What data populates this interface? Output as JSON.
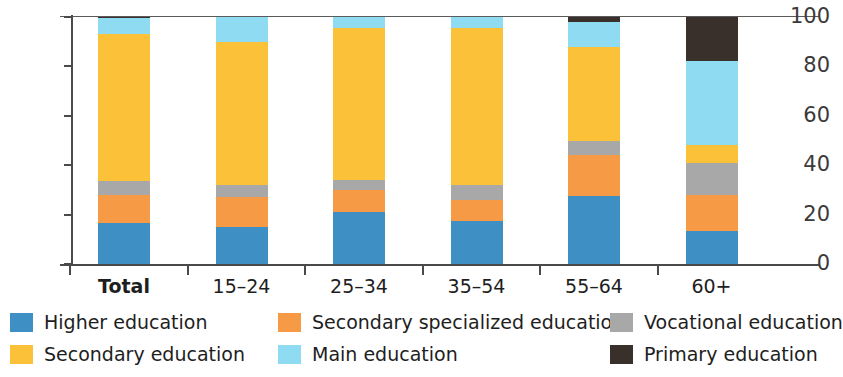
{
  "chart_data": {
    "type": "bar",
    "title": "",
    "subtitle": "",
    "xlabel": "",
    "ylabel": "",
    "stacked": true,
    "stack_mode": "percent",
    "grid": false,
    "legend_position": "bottom",
    "ylim": [
      0,
      100
    ],
    "yticks": [
      0,
      20,
      40,
      60,
      80,
      100
    ],
    "ytick_labels": [
      "0",
      "20",
      "40",
      "60",
      "80",
      "100"
    ],
    "categories": [
      "Total",
      "15–24",
      "25–34",
      "35–54",
      "55–64",
      "60+"
    ],
    "series": [
      {
        "name": "Higher education",
        "color": "#3D8FC4",
        "values": [
          16.5,
          15.0,
          21.0,
          17.5,
          27.5,
          13.5
        ]
      },
      {
        "name": "Secondary specialized education",
        "color": "#F79A46",
        "values": [
          11.5,
          12.0,
          9.0,
          8.5,
          16.5,
          14.5
        ]
      },
      {
        "name": "Vocational education",
        "color": "#A8A8A8",
        "values": [
          5.5,
          5.0,
          4.0,
          6.0,
          6.0,
          13.0
        ]
      },
      {
        "name": "Secondary education",
        "color": "#FBC138",
        "values": [
          59.5,
          58.0,
          61.5,
          63.5,
          38.0,
          7.0
        ]
      },
      {
        "name": "Main education",
        "color": "#8FDCF2",
        "values": [
          6.5,
          10.0,
          4.5,
          4.5,
          10.0,
          34.0
        ]
      },
      {
        "name": "Primary education",
        "color": "#3A302B",
        "values": [
          0.5,
          0.0,
          0.0,
          0.0,
          2.0,
          18.0
        ]
      }
    ]
  },
  "axes": {
    "y_tick_labels": [
      "100",
      "80",
      "60",
      "40",
      "20",
      "0"
    ],
    "x_tick_labels": [
      "Total",
      "15–24",
      "25–34",
      "35–54",
      "55–64",
      "60+"
    ]
  },
  "legend": {
    "items": [
      {
        "label": "Higher education",
        "color": "#3D8FC4"
      },
      {
        "label": "Secondary specialized education",
        "color": "#F79A46"
      },
      {
        "label": "Vocational education",
        "color": "#A8A8A8"
      },
      {
        "label": "Secondary education",
        "color": "#FBC138"
      },
      {
        "label": "Main education",
        "color": "#8FDCF2"
      },
      {
        "label": "Primary education",
        "color": "#3A302B"
      }
    ]
  }
}
